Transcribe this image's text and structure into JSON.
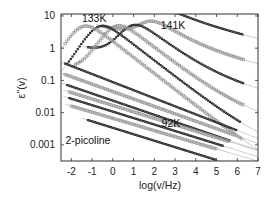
{
  "chart_data": {
    "type": "scatter",
    "title": "",
    "xlabel": "log(v/Hz)",
    "ylabel": "ε''(v)",
    "xlim": [
      -2.5,
      7
    ],
    "ylim_log10": [
      -3.5,
      1.06
    ],
    "yscale": "log",
    "x_ticks": [
      -2,
      -1,
      0,
      1,
      2,
      3,
      4,
      5,
      6,
      7
    ],
    "x_tick_labels": [
      "-2",
      "-1",
      "0",
      "1",
      "2",
      "3",
      "4",
      "5",
      "6",
      "7"
    ],
    "y_ticks": [
      10,
      1,
      0.1,
      0.01,
      0.001
    ],
    "y_tick_labels": [
      "10",
      "1",
      "0.1",
      "0.01",
      "0.001"
    ],
    "grid": false,
    "annotations": [
      {
        "text": "133K",
        "x": -0.9,
        "y": 6.3
      },
      {
        "text": "141K",
        "x": 2.9,
        "y": 3.9
      },
      {
        "text": "92K",
        "x": 2.8,
        "y": 0.0035
      },
      {
        "text": "2-picoline",
        "x": -1.2,
        "y": 0.0011
      }
    ],
    "series": [
      {
        "name": "141K",
        "style": "black",
        "peak_x": 2.5,
        "peak_y": 4.6,
        "x_start": 0.3,
        "x_end": 6.3,
        "tail_slope": -0.16
      },
      {
        "name": "139K",
        "style": "gray",
        "peak_x": 1.7,
        "peak_y": 4.6,
        "x_start": -0.5,
        "x_end": 6.3,
        "tail_slope": -0.16
      },
      {
        "name": "137K",
        "style": "black",
        "peak_x": 0.9,
        "peak_y": 4.6,
        "x_start": -1.2,
        "x_end": 6.3,
        "tail_slope": -0.16
      },
      {
        "name": "135K",
        "style": "gray",
        "peak_x": 0.1,
        "peak_y": 4.6,
        "x_start": -1.8,
        "x_end": 6.3,
        "tail_slope": -0.16
      },
      {
        "name": "133K",
        "style": "black",
        "peak_x": -0.7,
        "peak_y": 4.6,
        "x_start": -2.2,
        "x_end": 6.2,
        "tail_slope": -0.16
      },
      {
        "name": "131K",
        "style": "gray",
        "peak_x": -1.5,
        "peak_y": 4.6,
        "x_start": -2.3,
        "x_end": 6.2,
        "tail_slope": -0.16
      },
      {
        "name": "~125K",
        "style": "black",
        "flat": true,
        "y0": 0.28,
        "x_start": -2.3,
        "x_end": 6.0,
        "tail_slope": -0.25
      },
      {
        "name": "~120K",
        "style": "gray",
        "flat": true,
        "y0": 0.13,
        "x_start": -2.3,
        "x_end": 5.9,
        "tail_slope": -0.23
      },
      {
        "name": "~115K",
        "style": "black",
        "flat": true,
        "y0": 0.065,
        "x_start": -2.2,
        "x_end": 5.7,
        "tail_slope": -0.22
      },
      {
        "name": "~110K",
        "style": "gray",
        "flat": true,
        "y0": 0.042,
        "x_start": -2.1,
        "x_end": 5.6,
        "tail_slope": -0.2
      },
      {
        "name": "~105K",
        "style": "black",
        "flat": true,
        "y0": 0.027,
        "x_start": -2.1,
        "x_end": 5.3,
        "tail_slope": -0.2
      },
      {
        "name": "~100K",
        "style": "gray",
        "flat": true,
        "y0": 0.016,
        "x_start": -2.0,
        "x_end": 5.0,
        "tail_slope": -0.19
      },
      {
        "name": "92K",
        "style": "black",
        "flat": true,
        "y0": 0.0085,
        "x_start": -1.2,
        "x_end": 5.0,
        "tail_slope": -0.2
      }
    ],
    "fit_lines": {
      "color": "#9a9a9a",
      "count": 13
    }
  }
}
